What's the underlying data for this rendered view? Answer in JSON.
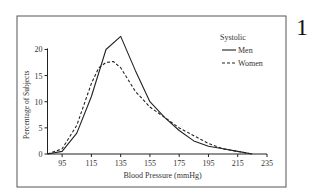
{
  "figure_number": "1",
  "chart_data": {
    "type": "line",
    "title": "",
    "xlabel": "Blood Pressure (mmHg)",
    "ylabel": "Percentage of Subjects",
    "xlim": [
      85,
      235
    ],
    "ylim": [
      0,
      22
    ],
    "xticks": [
      95,
      115,
      135,
      155,
      175,
      195,
      215,
      235
    ],
    "yticks": [
      0,
      5,
      10,
      15,
      20
    ],
    "grid": false,
    "legend": {
      "title": "Systolic",
      "placement": "top-right"
    },
    "series": [
      {
        "name": "Men",
        "style": "solid",
        "x": [
          85,
          95,
          105,
          115,
          125,
          135,
          145,
          155,
          165,
          175,
          185,
          195,
          205,
          215,
          225
        ],
        "y": [
          0,
          0.5,
          4,
          11,
          20,
          22.5,
          16,
          10,
          7,
          4.5,
          2.5,
          1.5,
          1,
          0.5,
          0
        ]
      },
      {
        "name": "Women",
        "style": "dashed",
        "x": [
          85,
          95,
          105,
          115,
          120,
          125,
          130,
          135,
          145,
          155,
          165,
          175,
          185,
          195,
          205,
          215,
          225
        ],
        "y": [
          0,
          1,
          5.5,
          13.5,
          16.5,
          17.5,
          17.7,
          16.5,
          12,
          9,
          7,
          5,
          3.5,
          2,
          1,
          0.5,
          0
        ]
      }
    ]
  }
}
